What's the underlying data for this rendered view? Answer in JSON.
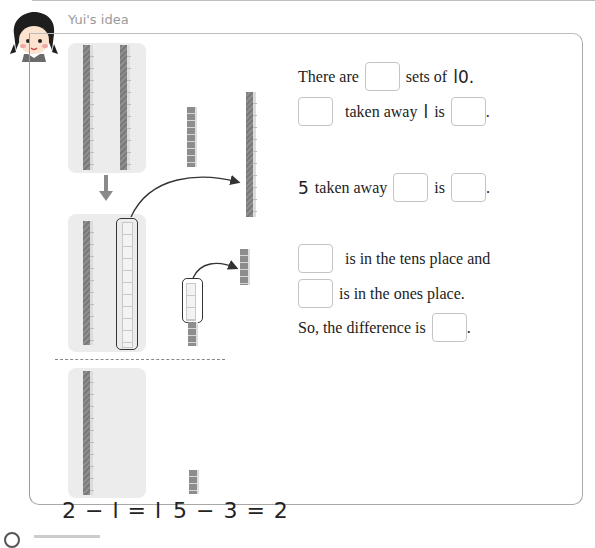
{
  "header": {
    "title": "Yui's idea"
  },
  "illustration": {
    "step1": {
      "tens_rods": 2,
      "ones_cubes": 5
    },
    "step2": {
      "tens_rods_remaining": 1,
      "tens_rod_taken": 1,
      "ones_cubes_taken": 3,
      "ones_cubes_remaining": 2
    },
    "step3": {
      "tens_rods": 1,
      "ones_cubes": 2
    }
  },
  "equations": {
    "tens": "2 − l = l",
    "ones": "5 − 3 = 2"
  },
  "questions": {
    "q1_prefix": "There are",
    "q1_suffix": "sets of",
    "q1_number": "l0.",
    "q2_middle": "taken away",
    "q2_number": "l",
    "q2_suffix": "is",
    "q2_end": ".",
    "q3_number": "5",
    "q3_middle": "taken away",
    "q3_suffix": "is",
    "q3_end": ".",
    "q4_suffix": "is in the tens place and",
    "q5_suffix": "is in the ones place.",
    "q6_prefix": "So, the difference is",
    "q6_end": "."
  },
  "colors": {
    "panel_bg": "#ececec",
    "rod": "#7a7a7a",
    "frame_border": "#a8a8a8",
    "title": "#9a9a9a"
  }
}
